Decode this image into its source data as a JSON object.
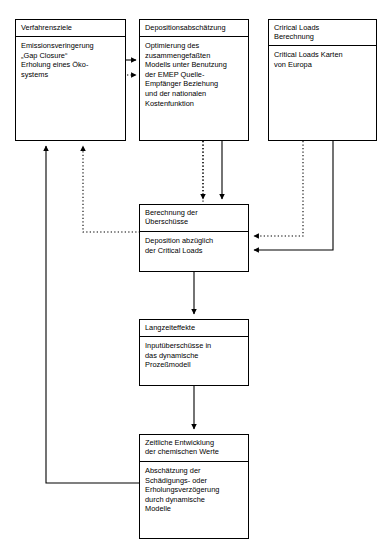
{
  "diagram": {
    "type": "flowchart",
    "language": "de",
    "canvas": {
      "width": 389,
      "height": 559
    },
    "line_color": "#000000",
    "background_color": "#ffffff",
    "nodes": [
      {
        "id": "goals",
        "title": "Verfahrensziele",
        "body": "Emissionsveringerung\n„Gap Closure“\nErholung eines Öko-\nsystems"
      },
      {
        "id": "deposition",
        "title": "Depositionsabschätzung",
        "body": "Optimierung des\nzusammengefaßten\nModells unter Benutzung\nder EMEP Quelle-\nEmpfänger Beziehung\nund der nationalen\nKostenfunktion"
      },
      {
        "id": "criticalloads",
        "title": "Crirical Loads\nBerechnung",
        "body": "Critical Loads Karten\nvon Europa"
      },
      {
        "id": "exceedance",
        "title": "Berechnung der\nÜberschüsse",
        "body": "Deposition abzüglich\nder Critical Loads"
      },
      {
        "id": "longterm",
        "title": "Langzeiteffekte",
        "body": "Inputüberschüsse in\ndas dynamische\nProzeßmodell"
      },
      {
        "id": "temporal",
        "title": "Zeitliche Entwicklung\nder chemischen Werte",
        "body": "Abschätzung der\nSchädigungs- oder\nErholungsverzögerung\ndurch dynamische\nModelle"
      }
    ],
    "edges": [
      {
        "id": "goals-to-deposition-solid",
        "from": "goals",
        "to": "deposition",
        "style": "solid"
      },
      {
        "id": "goals-to-deposition-dotted",
        "from": "goals",
        "to": "deposition",
        "style": "dotted"
      },
      {
        "id": "deposition-to-exceedance",
        "from": "deposition",
        "to": "exceedance",
        "style": "solid"
      },
      {
        "id": "deposition-to-goals-dotted",
        "from": "deposition",
        "to": "goals",
        "style": "dotted"
      },
      {
        "id": "criticalloads-to-exceedance",
        "from": "criticalloads",
        "to": "exceedance",
        "style": "solid"
      },
      {
        "id": "criticalloads-to-exceedance-dotted",
        "from": "criticalloads",
        "to": "exceedance",
        "style": "dotted"
      },
      {
        "id": "exceedance-to-longterm",
        "from": "exceedance",
        "to": "longterm",
        "style": "solid"
      },
      {
        "id": "longterm-to-temporal",
        "from": "longterm",
        "to": "temporal",
        "style": "solid"
      },
      {
        "id": "temporal-to-goals",
        "from": "temporal",
        "to": "goals",
        "style": "solid"
      }
    ]
  }
}
